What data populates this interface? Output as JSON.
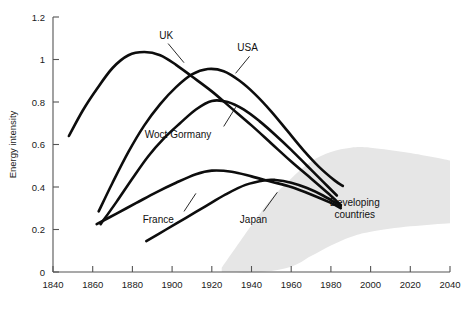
{
  "chart_data": {
    "type": "line",
    "title": "",
    "xlabel": "",
    "ylabel": "Energy intensity",
    "xlim": [
      1840,
      2040
    ],
    "ylim": [
      0,
      1.2
    ],
    "xticks": [
      1840,
      1860,
      1880,
      1900,
      1920,
      1940,
      1960,
      1980,
      2000,
      2020,
      2040
    ],
    "yticks": [
      0,
      0.2,
      0.4,
      0.6,
      0.8,
      1,
      1.2
    ],
    "ytick_labels": [
      "0",
      "0.2",
      "0.4",
      "0.6",
      "0.8",
      "1",
      "1.2"
    ],
    "xtick_labels": [
      "1840",
      "1860",
      "1880",
      "1900",
      "1920",
      "1940",
      "1960",
      "1980",
      "2000",
      "2020",
      "2040"
    ],
    "grid": false,
    "legend": "inline-annotations",
    "series": [
      {
        "name": "UK",
        "label": "UK",
        "color": "#0d0d0d",
        "points": [
          [
            1848,
            0.64
          ],
          [
            1855,
            0.76
          ],
          [
            1862,
            0.86
          ],
          [
            1870,
            0.96
          ],
          [
            1878,
            1.02
          ],
          [
            1886,
            1.035
          ],
          [
            1894,
            1.02
          ],
          [
            1902,
            0.975
          ],
          [
            1910,
            0.92
          ],
          [
            1920,
            0.85
          ],
          [
            1930,
            0.77
          ],
          [
            1940,
            0.69
          ],
          [
            1950,
            0.605
          ],
          [
            1960,
            0.52
          ],
          [
            1970,
            0.44
          ],
          [
            1978,
            0.375
          ],
          [
            1985,
            0.315
          ]
        ]
      },
      {
        "name": "USA",
        "label": "USA",
        "color": "#0d0d0d",
        "points": [
          [
            1863,
            0.285
          ],
          [
            1870,
            0.42
          ],
          [
            1878,
            0.565
          ],
          [
            1886,
            0.69
          ],
          [
            1894,
            0.79
          ],
          [
            1902,
            0.87
          ],
          [
            1910,
            0.93
          ],
          [
            1918,
            0.955
          ],
          [
            1926,
            0.945
          ],
          [
            1934,
            0.9
          ],
          [
            1942,
            0.835
          ],
          [
            1950,
            0.755
          ],
          [
            1958,
            0.665
          ],
          [
            1966,
            0.575
          ],
          [
            1974,
            0.495
          ],
          [
            1982,
            0.43
          ],
          [
            1986,
            0.405
          ]
        ]
      },
      {
        "name": "West Germany",
        "label": "Woct Gormany",
        "color": "#0d0d0d",
        "points": [
          [
            1864,
            0.225
          ],
          [
            1872,
            0.33
          ],
          [
            1880,
            0.44
          ],
          [
            1888,
            0.545
          ],
          [
            1896,
            0.63
          ],
          [
            1904,
            0.7
          ],
          [
            1912,
            0.765
          ],
          [
            1920,
            0.805
          ],
          [
            1928,
            0.8
          ],
          [
            1936,
            0.765
          ],
          [
            1944,
            0.71
          ],
          [
            1952,
            0.645
          ],
          [
            1960,
            0.575
          ],
          [
            1968,
            0.5
          ],
          [
            1976,
            0.425
          ],
          [
            1983,
            0.36
          ]
        ]
      },
      {
        "name": "France",
        "label": "France",
        "color": "#0d0d0d",
        "points": [
          [
            1862,
            0.225
          ],
          [
            1872,
            0.275
          ],
          [
            1882,
            0.325
          ],
          [
            1892,
            0.375
          ],
          [
            1902,
            0.42
          ],
          [
            1912,
            0.46
          ],
          [
            1920,
            0.477
          ],
          [
            1930,
            0.472
          ],
          [
            1940,
            0.45
          ],
          [
            1950,
            0.425
          ],
          [
            1960,
            0.4
          ],
          [
            1970,
            0.365
          ],
          [
            1980,
            0.325
          ],
          [
            1985,
            0.3
          ]
        ]
      },
      {
        "name": "Japan",
        "label": "Japan",
        "color": "#0d0d0d",
        "points": [
          [
            1887,
            0.145
          ],
          [
            1897,
            0.2
          ],
          [
            1907,
            0.255
          ],
          [
            1917,
            0.31
          ],
          [
            1927,
            0.365
          ],
          [
            1937,
            0.41
          ],
          [
            1947,
            0.432
          ],
          [
            1952,
            0.433
          ],
          [
            1960,
            0.42
          ],
          [
            1968,
            0.395
          ],
          [
            1976,
            0.36
          ],
          [
            1985,
            0.31
          ]
        ]
      }
    ],
    "bands": [
      {
        "name": "Developing countries",
        "label_line1": "Developing",
        "label_line2": "countries",
        "color": "#e6e6e6",
        "upper": [
          [
            1925,
            0.02
          ],
          [
            1940,
            0.22
          ],
          [
            1950,
            0.345
          ],
          [
            1960,
            0.44
          ],
          [
            1970,
            0.52
          ],
          [
            1980,
            0.565
          ],
          [
            1990,
            0.585
          ],
          [
            2000,
            0.585
          ],
          [
            2020,
            0.56
          ],
          [
            2040,
            0.525
          ]
        ],
        "lower": [
          [
            1925,
            0.0
          ],
          [
            1945,
            0.0
          ],
          [
            1960,
            0.025
          ],
          [
            1970,
            0.075
          ],
          [
            1980,
            0.125
          ],
          [
            1990,
            0.165
          ],
          [
            2000,
            0.19
          ],
          [
            2020,
            0.215
          ],
          [
            2040,
            0.23
          ]
        ]
      }
    ],
    "annotations": [
      {
        "series": "UK",
        "label": "UK",
        "text_x": 1897,
        "text_y": 1.115,
        "leader_from": [
          1898,
          1.075
        ],
        "leader_to": [
          1906,
          0.985
        ]
      },
      {
        "series": "USA",
        "label": "USA",
        "text_x": 1938,
        "text_y": 1.055,
        "leader_from": [
          1939,
          1.015
        ],
        "leader_to": [
          1932,
          0.935
        ]
      },
      {
        "series": "West Germany",
        "label": "Woct Gormany",
        "text_x": 1903,
        "text_y": 0.645,
        "leader_from": [
          1926,
          0.685
        ],
        "leader_to": [
          1932,
          0.775
        ]
      },
      {
        "series": "France",
        "label": "France",
        "text_x": 1893,
        "text_y": 0.245,
        "leader_from": [
          1906,
          0.285
        ],
        "leader_to": [
          1912,
          0.37
        ]
      },
      {
        "series": "Japan",
        "label": "Japan",
        "text_x": 1941,
        "text_y": 0.245,
        "leader_from": [
          1946,
          0.285
        ],
        "leader_to": [
          1953,
          0.375
        ]
      }
    ]
  },
  "axis": {
    "y_title": "Energy intensity"
  }
}
